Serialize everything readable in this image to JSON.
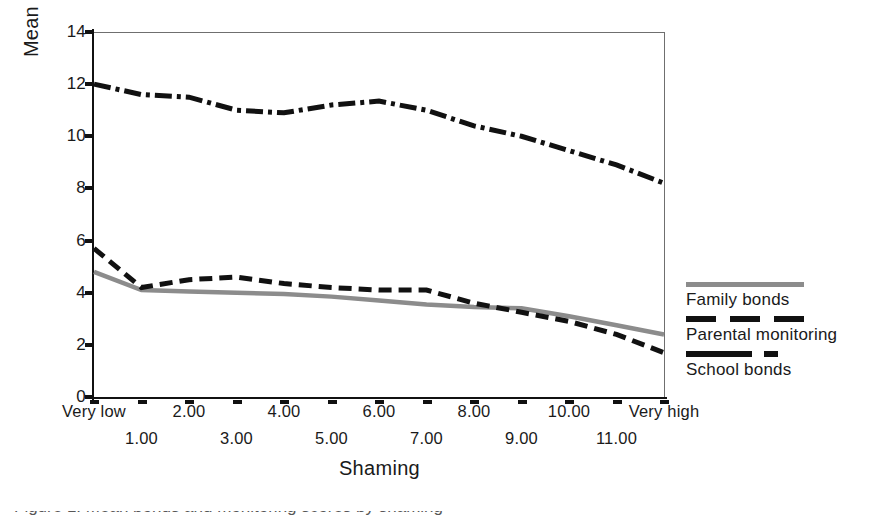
{
  "chart_data": {
    "type": "line",
    "title": "",
    "xlabel": "Shaming",
    "ylabel": "Mean bonds and monitoring scores",
    "ylim": [
      0,
      14
    ],
    "ytick_values": [
      0,
      2,
      4,
      6,
      8,
      10,
      12,
      14
    ],
    "ytick_labels": [
      "0",
      "2",
      "4",
      "6",
      "8",
      "10",
      "12",
      "14"
    ],
    "grid": false,
    "legend_position": "right",
    "categories": [
      "Very low",
      "1.00",
      "2.00",
      "3.00",
      "4.00",
      "5.00",
      "6.00",
      "7.00",
      "8.00",
      "9.00",
      "10.00",
      "11.00",
      "Very high"
    ],
    "series": [
      {
        "name": "Family bonds",
        "style": "solid",
        "color": "#8c8c8c",
        "values": [
          4.8,
          4.1,
          4.05,
          4.0,
          3.95,
          3.85,
          3.7,
          3.55,
          3.45,
          3.4,
          3.1,
          2.75,
          2.4
        ]
      },
      {
        "name": "Parental monitoring",
        "style": "dashed",
        "color": "#111111",
        "values": [
          5.7,
          4.2,
          4.5,
          4.6,
          4.35,
          4.2,
          4.1,
          4.1,
          3.6,
          3.25,
          2.9,
          2.4,
          1.7
        ]
      },
      {
        "name": "School bonds",
        "style": "dash-dot",
        "color": "#111111",
        "values": [
          12.0,
          11.6,
          11.5,
          11.0,
          10.9,
          11.2,
          11.35,
          11.0,
          10.4,
          10.0,
          9.45,
          8.9,
          8.2
        ]
      }
    ],
    "school_bonds_extended_note": "",
    "annotations": []
  },
  "legend": {
    "entries": [
      {
        "label": "Family bonds",
        "swatch": "legend-swatch-solid-gray"
      },
      {
        "label": "Parental monitoring",
        "swatch": "legend-swatch-dashed-black"
      },
      {
        "label": "School bonds",
        "swatch": "legend-swatch-dashdot-black"
      }
    ]
  },
  "axes": {
    "y_title": "Mean bonds and monitoring scores",
    "x_title": "Shaming",
    "y_ticks": [
      "14",
      "12",
      "10",
      "8",
      "6",
      "4",
      "2",
      "0"
    ],
    "x_ticks_row_top": [
      "Very low",
      "2.00",
      "4.00",
      "6.00",
      "8.00",
      "10.00",
      "Very high"
    ],
    "x_ticks_row_bottom": [
      "1.00",
      "3.00",
      "5.00",
      "7.00",
      "9.00",
      "11.00"
    ]
  },
  "caption": {
    "text": "Figure 1. Mean bonds and monitoring scores by shaming"
  }
}
